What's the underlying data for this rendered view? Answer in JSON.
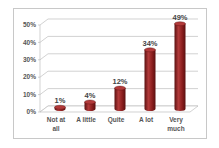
{
  "chart_data": {
    "type": "bar",
    "style": "3d-cylinder",
    "title": "",
    "xlabel": "",
    "ylabel": "",
    "categories": [
      "Not at all",
      "A little",
      "Quite",
      "A lot",
      "Very much"
    ],
    "category_lines": [
      [
        "Not at",
        "all"
      ],
      [
        "A little"
      ],
      [
        "Quite"
      ],
      [
        "A lot"
      ],
      [
        "Very",
        "much"
      ]
    ],
    "values": [
      1,
      4,
      12,
      34,
      49
    ],
    "data_labels": [
      "1%",
      "4%",
      "12%",
      "34%",
      "49%"
    ],
    "ylim": [
      0,
      50
    ],
    "yticks": [
      0,
      10,
      20,
      30,
      40,
      50
    ],
    "ytick_labels": [
      "0%",
      "10%",
      "20%",
      "30%",
      "40%",
      "50%"
    ],
    "grid": true,
    "legend": "none",
    "colors": {
      "bar": "#8b1e1e",
      "bar_dark": "#5a1010",
      "bar_light": "#b23a3a",
      "grid": "#bfbfbf",
      "frame": "#c8c8c8"
    }
  }
}
